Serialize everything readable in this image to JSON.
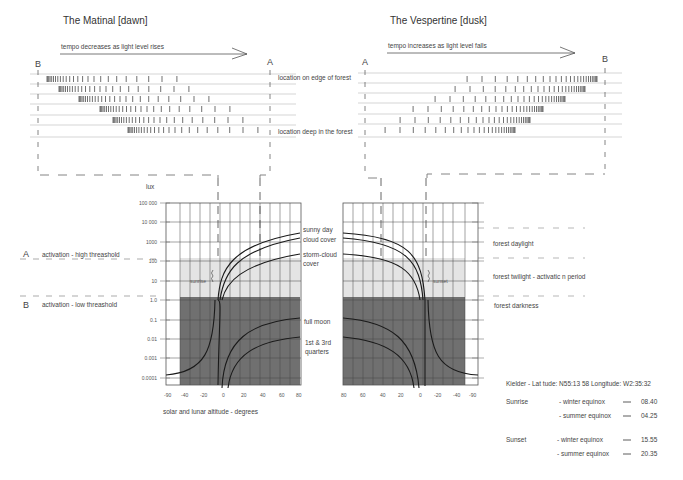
{
  "matinal": {
    "title": "The Matinal [dawn]",
    "arrow_label": "tempo decreases as light level rises",
    "marker_left": "B",
    "marker_right": "A"
  },
  "vespertine": {
    "title": "The Vespertine [dusk]",
    "arrow_label": "tempo increases as light level falls",
    "marker_left": "A",
    "marker_right": "B"
  },
  "locations": {
    "edge": "location on edge of forest",
    "deep": "location deep in the forest"
  },
  "thresholds": {
    "a_letter": "A",
    "a_label": "activation  - high threashold",
    "b_letter": "B",
    "b_label": "activation  - low threashold"
  },
  "zones": {
    "daylight": "forest daylight",
    "twilight": "forest twilight -  activatic n period",
    "darkness": "forest darkness"
  },
  "chart_data": [
    {
      "type": "line",
      "title": "Dawn illuminance vs altitude",
      "ylabel": "lux",
      "xlabel": "solar and lunar altitude - degrees",
      "y_ticks": [
        "100 000",
        "10 000",
        "1000",
        "100",
        "10",
        "1.0",
        "0.1",
        "0.01",
        "0.001",
        "0.0001"
      ],
      "x_ticks": [
        "-90",
        "-40",
        "-20",
        "0",
        "20",
        "40",
        "60",
        "80"
      ],
      "annotations": [
        "sunrise",
        "sunny day",
        "cloud cover",
        "storm-cloud cover",
        "full moon",
        "1st & 3rd quarters"
      ],
      "series": [
        {
          "name": "sunny day",
          "approx_lux_at_80deg": 2500
        },
        {
          "name": "cloud cover",
          "approx_lux_at_80deg": 1500
        },
        {
          "name": "storm-cloud cover",
          "approx_lux_at_80deg": 200
        },
        {
          "name": "full moon",
          "approx_lux_at_80deg": 0.2
        },
        {
          "name": "1st & 3rd quarters",
          "approx_lux_at_80deg": 0.02
        }
      ],
      "bands": [
        {
          "name": "forest twilight",
          "from_lux": 1.0,
          "to_lux": 200,
          "color": "#e3e3e3"
        },
        {
          "name": "forest darkness",
          "from_lux": 5e-05,
          "to_lux": 1.0,
          "color": "#6f6f6f"
        }
      ]
    },
    {
      "type": "line",
      "title": "Dusk illuminance vs altitude",
      "x_ticks": [
        "80",
        "60",
        "40",
        "20",
        "0",
        "-20",
        "-40",
        "-90"
      ],
      "annotations": [
        "sunset"
      ]
    }
  ],
  "chart_labels": {
    "lux": "lux",
    "y_ticks": [
      "100 000",
      "10 000",
      "1000",
      "100",
      "10",
      "1.0",
      "0.1",
      "0.01",
      "0.001",
      "0.0001"
    ],
    "x_left": [
      "-90",
      "-40",
      "-20",
      "0",
      "20",
      "40",
      "60",
      "80"
    ],
    "x_right": [
      "80",
      "60",
      "40",
      "20",
      "0",
      "-20",
      "-40",
      "-90"
    ],
    "xlabel": "solar and lunar altitude - degrees",
    "sunrise": "sunrise",
    "sunset": "sunset",
    "sunny_day": "sunny day",
    "cloud_cover": "cloud cover",
    "storm_1": "storm-cloud",
    "storm_2": "cover",
    "full_moon": "full moon",
    "quarters_1": "1st & 3rd",
    "quarters_2": "quarters"
  },
  "location_info": {
    "header": "Kielder - Lat tude: N55:13 58  Longitude: W2:35:32",
    "sunrise_label": "Sunrise",
    "sunset_label": "Sunset",
    "rows": [
      {
        "event": "sunrise",
        "season": "- winter equinox",
        "dash": "—",
        "time": "08.40"
      },
      {
        "event": "sunrise",
        "season": "- summer equinox",
        "dash": "—",
        "time": "04.25"
      },
      {
        "event": "sunset",
        "season": "- winter equinox",
        "dash": "—",
        "time": "15.55"
      },
      {
        "event": "sunset",
        "season": "- summer equinox",
        "dash": "—",
        "time": "20.35"
      }
    ]
  },
  "colors": {
    "line": "#222222",
    "grid": "#555555",
    "twilight_band": "#e4e4e4",
    "dark_band": "#707070",
    "rule": "#bbbbbb",
    "dash": "#777777"
  }
}
